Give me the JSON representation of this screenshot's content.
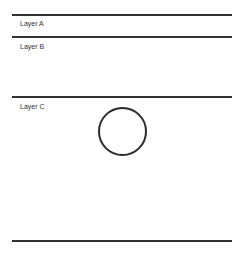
{
  "diagram": {
    "title": "",
    "layers": [
      {
        "label": "Layer A",
        "top_rule_y": 14,
        "label_y": 20
      },
      {
        "label": "Layer B",
        "top_rule_y": 36,
        "label_y": 43
      },
      {
        "label": "Layer C",
        "top_rule_y": 96,
        "label_y": 103
      }
    ],
    "bottom_rule_y": 240,
    "shapes": [
      {
        "type": "circle",
        "layer": "Layer C",
        "cx": 122,
        "cy": 131,
        "r": 24,
        "fill": "none",
        "stroke": "#2b2b2b"
      }
    ],
    "colors": {
      "line": "#333333",
      "background": "#ffffff"
    }
  }
}
